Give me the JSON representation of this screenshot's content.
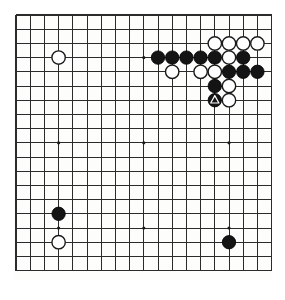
{
  "board": {
    "title": "Go board position",
    "size": 19,
    "colors": {
      "board_background": "#fdfdfb",
      "page_background": "#ffffff",
      "grid_line": "#2b2b2b",
      "black_stone": "#141414",
      "white_stone": "#ffffff",
      "stone_outline": "#1a1a1a",
      "star_point": "#1a1a1a",
      "marker": "#ffffff"
    },
    "geometry": {
      "origin_x": 16,
      "origin_y": 15,
      "cell": 14.2,
      "stone_radius": 6.7,
      "star_radius": 1.6
    },
    "star_points": [
      {
        "col": 3,
        "row": 3
      },
      {
        "col": 9,
        "row": 3
      },
      {
        "col": 15,
        "row": 3
      },
      {
        "col": 3,
        "row": 9
      },
      {
        "col": 9,
        "row": 9
      },
      {
        "col": 15,
        "row": 9
      },
      {
        "col": 3,
        "row": 15
      },
      {
        "col": 9,
        "row": 15
      },
      {
        "col": 15,
        "row": 15
      }
    ],
    "stones": [
      {
        "col": 3,
        "row": 3,
        "color": "white",
        "marker": "none"
      },
      {
        "col": 14,
        "row": 2,
        "color": "white",
        "marker": "none"
      },
      {
        "col": 15,
        "row": 2,
        "color": "white",
        "marker": "none"
      },
      {
        "col": 16,
        "row": 2,
        "color": "white",
        "marker": "none"
      },
      {
        "col": 17,
        "row": 2,
        "color": "white",
        "marker": "none"
      },
      {
        "col": 10,
        "row": 3,
        "color": "black",
        "marker": "none"
      },
      {
        "col": 11,
        "row": 3,
        "color": "black",
        "marker": "none"
      },
      {
        "col": 12,
        "row": 3,
        "color": "black",
        "marker": "none"
      },
      {
        "col": 13,
        "row": 3,
        "color": "black",
        "marker": "none"
      },
      {
        "col": 14,
        "row": 3,
        "color": "black",
        "marker": "none"
      },
      {
        "col": 15,
        "row": 3,
        "color": "white",
        "marker": "none"
      },
      {
        "col": 16,
        "row": 3,
        "color": "black",
        "marker": "none"
      },
      {
        "col": 11,
        "row": 4,
        "color": "white",
        "marker": "none"
      },
      {
        "col": 13,
        "row": 4,
        "color": "white",
        "marker": "none"
      },
      {
        "col": 14,
        "row": 4,
        "color": "white",
        "marker": "none"
      },
      {
        "col": 15,
        "row": 4,
        "color": "black",
        "marker": "none"
      },
      {
        "col": 16,
        "row": 4,
        "color": "black",
        "marker": "none"
      },
      {
        "col": 17,
        "row": 4,
        "color": "black",
        "marker": "none"
      },
      {
        "col": 14,
        "row": 5,
        "color": "black",
        "marker": "none"
      },
      {
        "col": 15,
        "row": 5,
        "color": "white",
        "marker": "none"
      },
      {
        "col": 14,
        "row": 6,
        "color": "black",
        "marker": "triangle"
      },
      {
        "col": 15,
        "row": 6,
        "color": "white",
        "marker": "none"
      },
      {
        "col": 3,
        "row": 14,
        "color": "black",
        "marker": "none"
      },
      {
        "col": 3,
        "row": 16,
        "color": "white",
        "marker": "none"
      },
      {
        "col": 15,
        "row": 16,
        "color": "black",
        "marker": "none"
      }
    ],
    "summary": {
      "black_count": "14",
      "white_count": "11",
      "marked_stone": "black triangle"
    }
  }
}
